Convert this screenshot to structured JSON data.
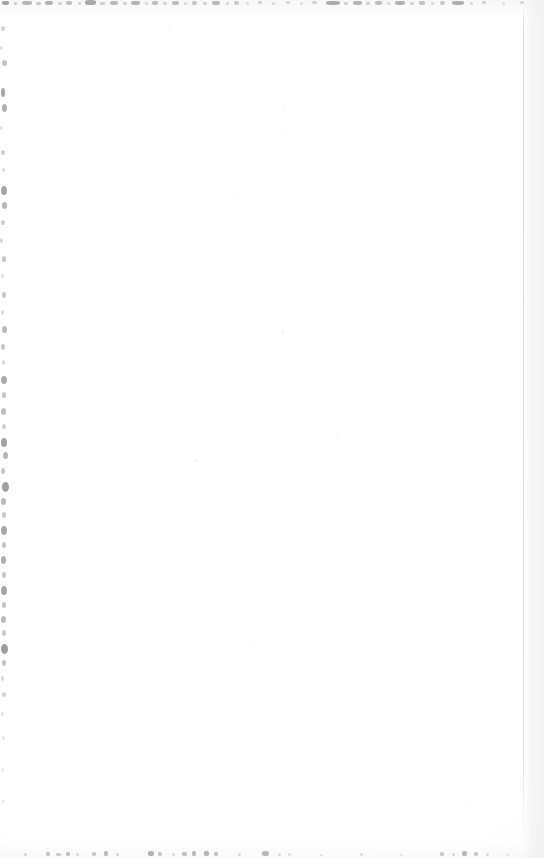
{
  "document": {
    "kind": "scanned-page",
    "content_type": "blank",
    "visible_text": "",
    "page_width": 544,
    "page_height": 858,
    "background_color": "#ffffff",
    "paper_tone": "#fdfdfd",
    "speck_color": "#6f6f72",
    "seam_color": "#ceced2",
    "description": "Blank scanned page with scanner edge noise"
  },
  "artifacts": {
    "top_edge": {
      "label": "top-edge-speckle-band",
      "y": 0,
      "height": 7,
      "marks": [
        {
          "x": 2,
          "y": 1,
          "w": 7,
          "h": 4,
          "o": 0.62
        },
        {
          "x": 14,
          "y": 2,
          "w": 3,
          "h": 3,
          "o": 0.3
        },
        {
          "x": 22,
          "y": 1,
          "w": 10,
          "h": 4,
          "o": 0.48
        },
        {
          "x": 36,
          "y": 2,
          "w": 5,
          "h": 3,
          "o": 0.34
        },
        {
          "x": 45,
          "y": 1,
          "w": 8,
          "h": 4,
          "o": 0.52
        },
        {
          "x": 58,
          "y": 2,
          "w": 4,
          "h": 3,
          "o": 0.28
        },
        {
          "x": 66,
          "y": 1,
          "w": 6,
          "h": 4,
          "o": 0.4
        },
        {
          "x": 78,
          "y": 2,
          "w": 3,
          "h": 3,
          "o": 0.26
        },
        {
          "x": 85,
          "y": 0,
          "w": 11,
          "h": 5,
          "o": 0.58
        },
        {
          "x": 100,
          "y": 2,
          "w": 5,
          "h": 3,
          "o": 0.32
        },
        {
          "x": 110,
          "y": 1,
          "w": 8,
          "h": 4,
          "o": 0.46
        },
        {
          "x": 123,
          "y": 2,
          "w": 4,
          "h": 3,
          "o": 0.3
        },
        {
          "x": 131,
          "y": 1,
          "w": 9,
          "h": 4,
          "o": 0.5
        },
        {
          "x": 145,
          "y": 2,
          "w": 3,
          "h": 3,
          "o": 0.24
        },
        {
          "x": 152,
          "y": 1,
          "w": 6,
          "h": 4,
          "o": 0.42
        },
        {
          "x": 163,
          "y": 2,
          "w": 4,
          "h": 3,
          "o": 0.28
        },
        {
          "x": 172,
          "y": 1,
          "w": 7,
          "h": 4,
          "o": 0.44
        },
        {
          "x": 184,
          "y": 2,
          "w": 3,
          "h": 3,
          "o": 0.22
        },
        {
          "x": 192,
          "y": 1,
          "w": 5,
          "h": 4,
          "o": 0.36
        },
        {
          "x": 203,
          "y": 2,
          "w": 4,
          "h": 3,
          "o": 0.3
        },
        {
          "x": 212,
          "y": 1,
          "w": 8,
          "h": 4,
          "o": 0.48
        },
        {
          "x": 226,
          "y": 2,
          "w": 3,
          "h": 3,
          "o": 0.24
        },
        {
          "x": 234,
          "y": 1,
          "w": 5,
          "h": 4,
          "o": 0.34
        },
        {
          "x": 246,
          "y": 2,
          "w": 3,
          "h": 3,
          "o": 0.2
        },
        {
          "x": 258,
          "y": 1,
          "w": 4,
          "h": 3,
          "o": 0.28
        },
        {
          "x": 272,
          "y": 2,
          "w": 3,
          "h": 3,
          "o": 0.22
        },
        {
          "x": 286,
          "y": 1,
          "w": 4,
          "h": 3,
          "o": 0.26
        },
        {
          "x": 300,
          "y": 2,
          "w": 3,
          "h": 3,
          "o": 0.2
        },
        {
          "x": 312,
          "y": 1,
          "w": 5,
          "h": 3,
          "o": 0.3
        },
        {
          "x": 326,
          "y": 1,
          "w": 14,
          "h": 4,
          "o": 0.56
        },
        {
          "x": 344,
          "y": 2,
          "w": 4,
          "h": 3,
          "o": 0.3
        },
        {
          "x": 353,
          "y": 1,
          "w": 9,
          "h": 4,
          "o": 0.5
        },
        {
          "x": 366,
          "y": 2,
          "w": 4,
          "h": 3,
          "o": 0.28
        },
        {
          "x": 375,
          "y": 1,
          "w": 7,
          "h": 4,
          "o": 0.44
        },
        {
          "x": 387,
          "y": 2,
          "w": 3,
          "h": 3,
          "o": 0.24
        },
        {
          "x": 395,
          "y": 1,
          "w": 10,
          "h": 4,
          "o": 0.52
        },
        {
          "x": 410,
          "y": 2,
          "w": 4,
          "h": 3,
          "o": 0.3
        },
        {
          "x": 419,
          "y": 1,
          "w": 6,
          "h": 4,
          "o": 0.4
        },
        {
          "x": 431,
          "y": 2,
          "w": 3,
          "h": 3,
          "o": 0.22
        },
        {
          "x": 440,
          "y": 1,
          "w": 5,
          "h": 4,
          "o": 0.34
        },
        {
          "x": 452,
          "y": 1,
          "w": 12,
          "h": 4,
          "o": 0.54
        },
        {
          "x": 470,
          "y": 2,
          "w": 3,
          "h": 3,
          "o": 0.24
        },
        {
          "x": 482,
          "y": 1,
          "w": 4,
          "h": 3,
          "o": 0.28
        },
        {
          "x": 502,
          "y": 2,
          "w": 3,
          "h": 3,
          "o": 0.18
        },
        {
          "x": 520,
          "y": 1,
          "w": 4,
          "h": 3,
          "o": 0.26
        }
      ]
    },
    "left_edge": {
      "label": "left-edge-speckle-band",
      "x": 0,
      "width": 13,
      "marks": [
        {
          "x": 1,
          "y": 26,
          "w": 4,
          "h": 5,
          "o": 0.3
        },
        {
          "x": 0,
          "y": 46,
          "w": 3,
          "h": 4,
          "o": 0.22
        },
        {
          "x": 2,
          "y": 60,
          "w": 5,
          "h": 6,
          "o": 0.42
        },
        {
          "x": 1,
          "y": 88,
          "w": 4,
          "h": 9,
          "o": 0.6
        },
        {
          "x": 2,
          "y": 104,
          "w": 5,
          "h": 8,
          "o": 0.55
        },
        {
          "x": 0,
          "y": 126,
          "w": 3,
          "h": 4,
          "o": 0.2
        },
        {
          "x": 1,
          "y": 150,
          "w": 4,
          "h": 5,
          "o": 0.34
        },
        {
          "x": 2,
          "y": 168,
          "w": 3,
          "h": 4,
          "o": 0.26
        },
        {
          "x": 1,
          "y": 186,
          "w": 6,
          "h": 9,
          "o": 0.62
        },
        {
          "x": 2,
          "y": 202,
          "w": 5,
          "h": 7,
          "o": 0.5
        },
        {
          "x": 1,
          "y": 220,
          "w": 4,
          "h": 5,
          "o": 0.36
        },
        {
          "x": 0,
          "y": 238,
          "w": 3,
          "h": 5,
          "o": 0.28
        },
        {
          "x": 2,
          "y": 256,
          "w": 4,
          "h": 6,
          "o": 0.4
        },
        {
          "x": 1,
          "y": 274,
          "w": 3,
          "h": 4,
          "o": 0.24
        },
        {
          "x": 2,
          "y": 292,
          "w": 4,
          "h": 6,
          "o": 0.38
        },
        {
          "x": 1,
          "y": 310,
          "w": 3,
          "h": 5,
          "o": 0.26
        },
        {
          "x": 2,
          "y": 326,
          "w": 5,
          "h": 7,
          "o": 0.48
        },
        {
          "x": 1,
          "y": 344,
          "w": 4,
          "h": 6,
          "o": 0.38
        },
        {
          "x": 2,
          "y": 360,
          "w": 3,
          "h": 5,
          "o": 0.28
        },
        {
          "x": 1,
          "y": 376,
          "w": 6,
          "h": 8,
          "o": 0.58
        },
        {
          "x": 2,
          "y": 392,
          "w": 4,
          "h": 6,
          "o": 0.4
        },
        {
          "x": 1,
          "y": 408,
          "w": 5,
          "h": 7,
          "o": 0.46
        },
        {
          "x": 2,
          "y": 424,
          "w": 4,
          "h": 5,
          "o": 0.34
        },
        {
          "x": 1,
          "y": 438,
          "w": 6,
          "h": 9,
          "o": 0.64
        },
        {
          "x": 3,
          "y": 452,
          "w": 5,
          "h": 7,
          "o": 0.5
        },
        {
          "x": 1,
          "y": 468,
          "w": 4,
          "h": 6,
          "o": 0.38
        },
        {
          "x": 2,
          "y": 482,
          "w": 7,
          "h": 10,
          "o": 0.66
        },
        {
          "x": 1,
          "y": 498,
          "w": 5,
          "h": 7,
          "o": 0.48
        },
        {
          "x": 2,
          "y": 512,
          "w": 4,
          "h": 6,
          "o": 0.36
        },
        {
          "x": 1,
          "y": 526,
          "w": 6,
          "h": 9,
          "o": 0.6
        },
        {
          "x": 2,
          "y": 542,
          "w": 4,
          "h": 6,
          "o": 0.4
        },
        {
          "x": 1,
          "y": 556,
          "w": 5,
          "h": 8,
          "o": 0.54
        },
        {
          "x": 2,
          "y": 572,
          "w": 4,
          "h": 6,
          "o": 0.38
        },
        {
          "x": 1,
          "y": 586,
          "w": 6,
          "h": 9,
          "o": 0.62
        },
        {
          "x": 2,
          "y": 602,
          "w": 4,
          "h": 6,
          "o": 0.42
        },
        {
          "x": 1,
          "y": 616,
          "w": 5,
          "h": 7,
          "o": 0.48
        },
        {
          "x": 2,
          "y": 630,
          "w": 4,
          "h": 6,
          "o": 0.36
        },
        {
          "x": 1,
          "y": 644,
          "w": 7,
          "h": 10,
          "o": 0.68
        },
        {
          "x": 2,
          "y": 660,
          "w": 4,
          "h": 6,
          "o": 0.4
        },
        {
          "x": 1,
          "y": 676,
          "w": 3,
          "h": 5,
          "o": 0.26
        },
        {
          "x": 2,
          "y": 692,
          "w": 4,
          "h": 5,
          "o": 0.3
        },
        {
          "x": 1,
          "y": 712,
          "w": 3,
          "h": 4,
          "o": 0.2
        },
        {
          "x": 2,
          "y": 736,
          "w": 3,
          "h": 4,
          "o": 0.18
        },
        {
          "x": 1,
          "y": 768,
          "w": 3,
          "h": 4,
          "o": 0.16
        },
        {
          "x": 2,
          "y": 800,
          "w": 3,
          "h": 3,
          "o": 0.14
        }
      ]
    },
    "bottom_edge": {
      "label": "bottom-edge-speckle-band",
      "y": 848,
      "height": 10,
      "marks": [
        {
          "x": 24,
          "y": 853,
          "w": 3,
          "h": 3,
          "o": 0.26
        },
        {
          "x": 46,
          "y": 852,
          "w": 4,
          "h": 4,
          "o": 0.38
        },
        {
          "x": 56,
          "y": 853,
          "w": 5,
          "h": 3,
          "o": 0.34
        },
        {
          "x": 66,
          "y": 852,
          "w": 4,
          "h": 4,
          "o": 0.4
        },
        {
          "x": 76,
          "y": 853,
          "w": 3,
          "h": 3,
          "o": 0.24
        },
        {
          "x": 92,
          "y": 852,
          "w": 4,
          "h": 4,
          "o": 0.36
        },
        {
          "x": 104,
          "y": 851,
          "w": 4,
          "h": 5,
          "o": 0.46
        },
        {
          "x": 116,
          "y": 853,
          "w": 3,
          "h": 3,
          "o": 0.26
        },
        {
          "x": 148,
          "y": 851,
          "w": 6,
          "h": 5,
          "o": 0.52
        },
        {
          "x": 158,
          "y": 852,
          "w": 4,
          "h": 4,
          "o": 0.38
        },
        {
          "x": 172,
          "y": 853,
          "w": 3,
          "h": 3,
          "o": 0.24
        },
        {
          "x": 182,
          "y": 852,
          "w": 5,
          "h": 4,
          "o": 0.42
        },
        {
          "x": 192,
          "y": 851,
          "w": 4,
          "h": 5,
          "o": 0.46
        },
        {
          "x": 204,
          "y": 851,
          "w": 5,
          "h": 5,
          "o": 0.5
        },
        {
          "x": 214,
          "y": 852,
          "w": 4,
          "h": 4,
          "o": 0.4
        },
        {
          "x": 238,
          "y": 853,
          "w": 3,
          "h": 3,
          "o": 0.22
        },
        {
          "x": 262,
          "y": 851,
          "w": 7,
          "h": 5,
          "o": 0.48
        },
        {
          "x": 278,
          "y": 853,
          "w": 3,
          "h": 3,
          "o": 0.22
        },
        {
          "x": 288,
          "y": 853,
          "w": 3,
          "h": 3,
          "o": 0.2
        },
        {
          "x": 320,
          "y": 854,
          "w": 3,
          "h": 2,
          "o": 0.18
        },
        {
          "x": 360,
          "y": 853,
          "w": 3,
          "h": 3,
          "o": 0.22
        },
        {
          "x": 400,
          "y": 854,
          "w": 3,
          "h": 2,
          "o": 0.16
        },
        {
          "x": 440,
          "y": 852,
          "w": 4,
          "h": 4,
          "o": 0.34
        },
        {
          "x": 452,
          "y": 853,
          "w": 3,
          "h": 3,
          "o": 0.24
        },
        {
          "x": 462,
          "y": 851,
          "w": 5,
          "h": 5,
          "o": 0.48
        },
        {
          "x": 474,
          "y": 852,
          "w": 4,
          "h": 4,
          "o": 0.36
        },
        {
          "x": 486,
          "y": 853,
          "w": 3,
          "h": 3,
          "o": 0.22
        },
        {
          "x": 506,
          "y": 854,
          "w": 3,
          "h": 2,
          "o": 0.16
        }
      ]
    },
    "interior_flecks": {
      "label": "interior-faint-flecks",
      "marks": [
        {
          "x": 281,
          "y": 331,
          "w": 3,
          "h": 4,
          "o": 0.55
        },
        {
          "x": 337,
          "y": 434,
          "w": 3,
          "h": 3,
          "o": 0.45
        },
        {
          "x": 194,
          "y": 459,
          "w": 3,
          "h": 4,
          "o": 0.5
        },
        {
          "x": 283,
          "y": 105,
          "w": 3,
          "h": 3,
          "o": 0.4
        },
        {
          "x": 281,
          "y": 128,
          "w": 2,
          "h": 3,
          "o": 0.35
        },
        {
          "x": 236,
          "y": 193,
          "w": 3,
          "h": 3,
          "o": 0.38
        },
        {
          "x": 168,
          "y": 28,
          "w": 3,
          "h": 3,
          "o": 0.42
        },
        {
          "x": 248,
          "y": 641,
          "w": 3,
          "h": 3,
          "o": 0.35
        },
        {
          "x": 463,
          "y": 802,
          "w": 3,
          "h": 3,
          "o": 0.32
        },
        {
          "x": 522,
          "y": 392,
          "w": 3,
          "h": 3,
          "o": 0.4
        }
      ]
    }
  }
}
